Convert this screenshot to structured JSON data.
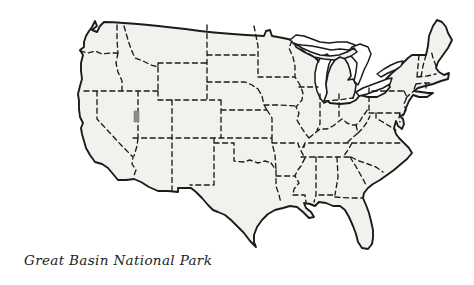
{
  "figure": {
    "caption": "Great Basin National Park"
  },
  "colors": {
    "land": "#f2f1ee",
    "line": "#1b1b1b",
    "water": "#ffffff",
    "marker": "#8d8d8d",
    "background": "#ffffff",
    "caption_text": "#222222"
  }
}
